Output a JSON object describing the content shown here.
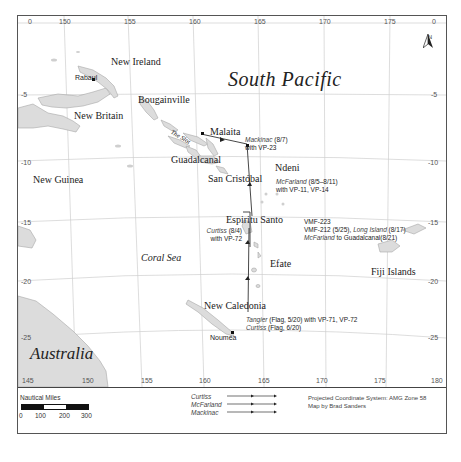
{
  "map": {
    "title": "South Pacific",
    "longitude_ticks_top": [
      "0",
      "150",
      "155",
      "160",
      "165",
      "170",
      "175",
      "0"
    ],
    "longitude_ticks_bottom": [
      "145",
      "150",
      "155",
      "160",
      "165",
      "170",
      "175",
      "180"
    ],
    "latitude_ticks_left": [
      "-5",
      "-10",
      "-15",
      "-20",
      "-25"
    ],
    "latitude_ticks_right": [
      "-5",
      "-10",
      "-15",
      "-20",
      "-25"
    ],
    "compass": {
      "label": "N"
    },
    "places": {
      "new_ireland": "New Ireland",
      "rabaul": "Rabaul",
      "bougainville": "Bougainville",
      "new_britain": "New Britain",
      "the_slot": "The Slot",
      "malaita": "Malaita",
      "guadalcanal": "Guadalcanal",
      "ndeni": "Ndeni",
      "new_guinea": "New Guinea",
      "san_cristobal": "San Cristóbal",
      "espiritu_santo": "Espiritu Santo",
      "coral_sea": "Coral Sea",
      "efate": "Efate",
      "fiji_islands": "Fiji Islands",
      "new_caledonia": "New Caledonia",
      "noumea": "Nouméa",
      "australia": "Australia"
    },
    "annotations": {
      "mackinac_ship": "Mackinac",
      "mackinac_date": " (8/7)",
      "mackinac_with": "with VP-23",
      "mcfarland_ship": "McFarland",
      "mcfarland_date": " (8/5–8/11)",
      "mcfarland_with": "with VP-11, VP-14",
      "vmf223": "VMF-223",
      "vmf212": "VMF-212 (5/25), ",
      "long_island_ship": "Long Island",
      "long_island_date": " (8/17)",
      "mcfarland2_ship": "McFarland",
      "mcfarland2_rest": " to Guadalcanal(8/21)",
      "curtiss_ship": "Curtiss",
      "curtiss_date": " (8/4)",
      "curtiss_with": "with VP-72",
      "tangier_ship": "Tangier",
      "tangier_rest": " (Flag, 5/20) with VP-71, VP-72",
      "curtiss2_ship": "Curtiss",
      "curtiss2_rest": " (Flag, 6/20)"
    }
  },
  "legend": {
    "scale_title": "Nautical Miles",
    "scale_ticks": [
      "0",
      "100",
      "200",
      "300"
    ],
    "routes": [
      {
        "name": "Curtiss"
      },
      {
        "name": "McFarland"
      },
      {
        "name": "Mackinac"
      }
    ],
    "projection": "Projected Coordinate System: AMG Zone 58",
    "credit": "Map by Brad Sanders"
  },
  "colors": {
    "land": "#dcdcdc",
    "land_stroke": "#a8a8a8",
    "grid": "#cfcfcf",
    "route": "#333333",
    "frame": "#555555"
  }
}
